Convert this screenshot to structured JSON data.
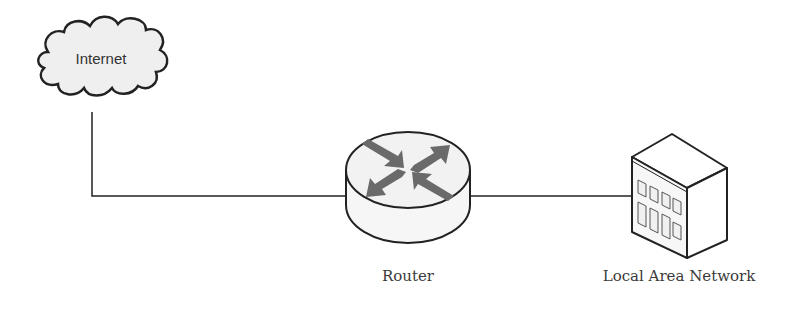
{
  "diagram": {
    "type": "network-topology",
    "nodes": [
      {
        "id": "internet",
        "label": "Internet",
        "icon": "cloud-icon"
      },
      {
        "id": "router",
        "label": "Router",
        "icon": "router-icon"
      },
      {
        "id": "lan",
        "label": "Local Area Network",
        "icon": "building-icon"
      }
    ],
    "edges": [
      {
        "from": "internet",
        "to": "router"
      },
      {
        "from": "router",
        "to": "lan"
      }
    ],
    "colors": {
      "stroke": "#222222",
      "arrow": "#6a6a6a",
      "fill": "#f4f4f4",
      "text": "#3a3a3a"
    }
  }
}
